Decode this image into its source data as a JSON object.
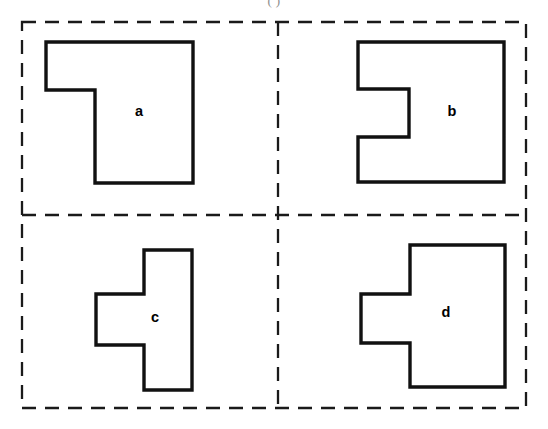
{
  "figure": {
    "caption": "(    )",
    "background_color": "#ffffff",
    "outline_color": "#111111",
    "dash_color": "#1a1a1a",
    "width": 548,
    "height": 429
  },
  "frame": {
    "name": "dashed-outer-frame",
    "x": 22,
    "y": 22,
    "width": 504,
    "height": 386,
    "dash_pattern": "14 9"
  },
  "dividers": {
    "vertical": {
      "name": "dashed-vertical-divider",
      "x": 278,
      "y1": 22,
      "y2": 408
    },
    "horizontal": {
      "name": "dashed-horizontal-divider",
      "y": 215,
      "x1": 22,
      "x2": 526
    }
  },
  "quadrants": [
    {
      "id": "a",
      "label": "a",
      "position": "top-left",
      "description": "square with notch removed from bottom-left corner",
      "label_x": 139,
      "label_y": 112,
      "points": "46,42 193,42 193,183 95,183 95,90 46,90"
    },
    {
      "id": "b",
      "label": "b",
      "position": "top-right",
      "description": "square with rectangular notch cut into middle of left side",
      "label_x": 452,
      "label_y": 112,
      "points": "358,42 504,42 504,182 358,182 358,137 409,137 409,89 358,89"
    },
    {
      "id": "c",
      "label": "c",
      "position": "bottom-left",
      "description": "vertical bar with horizontal arm extending left from the middle",
      "label_x": 155,
      "label_y": 318,
      "points": "144,250 192,250 192,390 144,390 144,345 96,345 96,294 144,294"
    },
    {
      "id": "d",
      "label": "d",
      "position": "bottom-right",
      "description": "square with rectangular tab protruding from middle of left side",
      "label_x": 446,
      "label_y": 313,
      "points": "410,245 505,245 505,387 410,387 410,343 361,343 361,294 410,294"
    }
  ]
}
